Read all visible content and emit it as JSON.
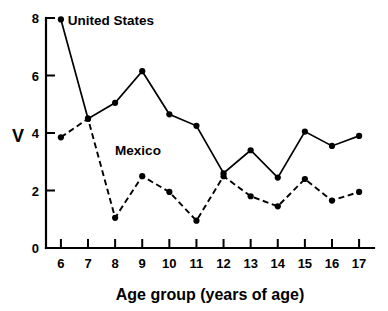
{
  "chart_data": {
    "type": "line",
    "title": "",
    "xlabel": "Age group (years of age)",
    "ylabel": "V",
    "categories": [
      6,
      7,
      8,
      9,
      10,
      11,
      12,
      13,
      14,
      15,
      16,
      17
    ],
    "x": [
      6,
      7,
      8,
      9,
      10,
      11,
      12,
      13,
      14,
      15,
      16,
      17
    ],
    "xlim": [
      5.45,
      17.55
    ],
    "ylim": [
      0,
      8
    ],
    "xticks": [
      "6",
      "7",
      "8",
      "9",
      "10",
      "11",
      "12",
      "13",
      "14",
      "15",
      "16",
      "17"
    ],
    "yticks": [
      "0",
      "2",
      "4",
      "6",
      "8"
    ],
    "ytick_values": [
      0,
      2,
      4,
      6,
      8
    ],
    "grid": false,
    "legend_position": "inline-annotation",
    "series": [
      {
        "name": "United States",
        "style": "solid",
        "marker": "filled-circle",
        "color": "#000000",
        "values": [
          7.95,
          4.5,
          5.05,
          6.15,
          4.65,
          4.25,
          2.6,
          3.4,
          2.45,
          4.05,
          3.55,
          3.9
        ]
      },
      {
        "name": "Mexico",
        "style": "dashed",
        "marker": "filled-circle",
        "color": "#000000",
        "values": [
          3.85,
          4.5,
          1.05,
          2.5,
          1.95,
          0.95,
          2.5,
          1.8,
          1.45,
          2.4,
          1.65,
          1.95
        ]
      }
    ],
    "annotations": [
      {
        "text": "United States",
        "x": 6.25,
        "y": 7.75
      },
      {
        "text": "Mexico",
        "x": 8.0,
        "y": 3.25
      }
    ]
  }
}
